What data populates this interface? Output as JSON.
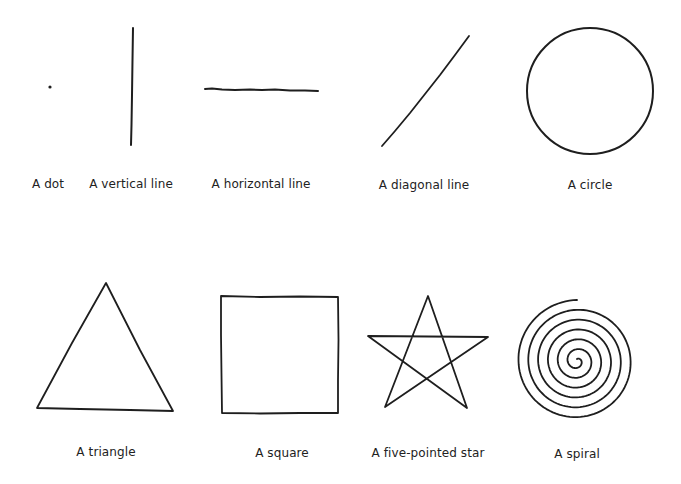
{
  "shapes": [
    {
      "id": "dot",
      "label": "A dot",
      "label_pos": [
        48,
        185
      ]
    },
    {
      "id": "vertical-line",
      "label": "A vertical line",
      "label_pos": [
        131,
        185
      ]
    },
    {
      "id": "horizontal-line",
      "label": "A horizontal line",
      "label_pos": [
        261,
        185
      ]
    },
    {
      "id": "diagonal-line",
      "label": "A diagonal line",
      "label_pos": [
        424,
        186
      ]
    },
    {
      "id": "circle",
      "label": "A circle",
      "label_pos": [
        590,
        186
      ]
    },
    {
      "id": "triangle",
      "label": "A triangle",
      "label_pos": [
        106,
        453
      ]
    },
    {
      "id": "square",
      "label": "A square",
      "label_pos": [
        282,
        454
      ]
    },
    {
      "id": "five-pointed-star",
      "label": "A five-pointed star",
      "label_pos": [
        428,
        454
      ]
    },
    {
      "id": "spiral",
      "label": "A spiral",
      "label_pos": [
        577,
        455
      ]
    }
  ],
  "stroke_color": "#1e1e1e",
  "background": "#ffffff"
}
